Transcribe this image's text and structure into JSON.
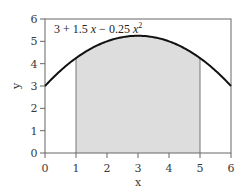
{
  "chart_data": {
    "type": "area",
    "title": "",
    "annotation": "3 + 1.5 x − 0.25 x²",
    "function": "3 + 1.5*x - 0.25*x^2",
    "xlabel": "x",
    "ylabel": "y",
    "xlim": [
      0,
      6
    ],
    "ylim": [
      0,
      6
    ],
    "x_ticks": [
      0,
      1,
      2,
      3,
      4,
      5,
      6
    ],
    "y_ticks": [
      0,
      1,
      2,
      3,
      4,
      5,
      6
    ],
    "grid": false,
    "legend": "none",
    "curve_points": {
      "x": [
        0,
        0.5,
        1,
        1.5,
        2,
        2.5,
        3,
        3.5,
        4,
        4.5,
        5,
        5.5,
        6
      ],
      "y": [
        3,
        3.6875,
        4.25,
        4.6875,
        5,
        5.1875,
        5.25,
        5.1875,
        5,
        4.6875,
        4.25,
        3.6875,
        3
      ]
    },
    "shaded_region": {
      "x_from": 1,
      "x_to": 5,
      "y_from": 0,
      "to_curve": true
    },
    "colors": {
      "curve": "#111111",
      "fill": "#dddddd",
      "axes": "#555555",
      "bounds": "#777777"
    }
  },
  "labels": {
    "eq_const": "3 + 1.5 ",
    "eq_x": "x",
    "eq_mid": " − 0.25 ",
    "eq_x2": "x",
    "eq_sup": "2",
    "xlabel": "x",
    "ylabel": "y",
    "xticks": [
      "0",
      "1",
      "2",
      "3",
      "4",
      "5",
      "6"
    ],
    "yticks": [
      "0",
      "1",
      "2",
      "3",
      "4",
      "5",
      "6"
    ]
  }
}
